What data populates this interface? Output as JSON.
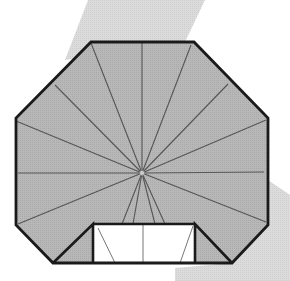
{
  "diagram": {
    "colors": {
      "background": "#ffffff",
      "shadow": "#d9d9d9",
      "paper_fill": "#b8b8b8",
      "outline": "#1a1a1a",
      "crease": "#555555",
      "pocket_fill": "#ffffff"
    },
    "outline_polygon": [
      [
        91,
        42
      ],
      [
        194,
        42
      ],
      [
        268,
        118
      ],
      [
        268,
        225
      ],
      [
        232,
        263
      ],
      [
        53,
        263
      ],
      [
        16,
        225
      ],
      [
        16,
        118
      ]
    ],
    "center": [
      142,
      173
    ],
    "crease_endpoints": [
      [
        91,
        43
      ],
      [
        142,
        43
      ],
      [
        191,
        45
      ],
      [
        228,
        84
      ],
      [
        266,
        120
      ],
      [
        264,
        172
      ],
      [
        266,
        222
      ],
      [
        18,
        224
      ],
      [
        18,
        173
      ],
      [
        16,
        121
      ],
      [
        55,
        85
      ],
      [
        122,
        224
      ],
      [
        133,
        224
      ],
      [
        155,
        224
      ],
      [
        165,
        224
      ]
    ],
    "pocket": {
      "rect": [
        93,
        224,
        195,
        264
      ],
      "inner_lines": [
        [
          [
            98,
            228
          ],
          [
            115,
            263
          ]
        ],
        [
          [
            143,
            224
          ],
          [
            143,
            263
          ]
        ],
        [
          [
            193,
            226
          ],
          [
            180,
            263
          ]
        ]
      ]
    },
    "flaps": {
      "left": [
        [
          16,
          225
        ],
        [
          93,
          224
        ],
        [
          93,
          263
        ],
        [
          53,
          263
        ]
      ],
      "right": [
        [
          195,
          224
        ],
        [
          268,
          225
        ],
        [
          232,
          263
        ],
        [
          195,
          263
        ]
      ]
    },
    "shadows": {
      "top": [
        [
          88,
          0
        ],
        [
          205,
          0
        ],
        [
          185,
          42
        ],
        [
          65,
          60
        ]
      ],
      "bottom_right": [
        [
          268,
          180
        ],
        [
          290,
          195
        ],
        [
          290,
          281
        ],
        [
          175,
          281
        ],
        [
          175,
          268
        ],
        [
          232,
          263
        ],
        [
          268,
          225
        ]
      ]
    }
  }
}
